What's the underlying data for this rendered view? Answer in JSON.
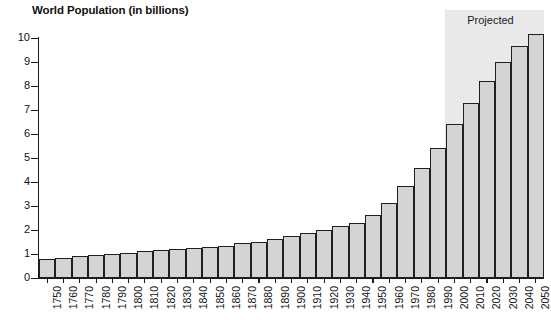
{
  "chart_data": {
    "type": "bar",
    "title": "World Population (in billions)",
    "xlabel": "",
    "ylabel": "",
    "ylim": [
      0,
      10
    ],
    "y_ticks": [
      0,
      1,
      2,
      3,
      4,
      5,
      6,
      7,
      8,
      9,
      10
    ],
    "grid": false,
    "legend": null,
    "annotations": [
      {
        "text": "Projected",
        "region_start_category": "2000",
        "region_end_category": "2050",
        "shading_color": "#e9e9e9"
      }
    ],
    "categories": [
      "1750",
      "1760",
      "1770",
      "1780",
      "1790",
      "1800",
      "1810",
      "1820",
      "1830",
      "1840",
      "1850",
      "1860",
      "1870",
      "1880",
      "1890",
      "1900",
      "1910",
      "1920",
      "1930",
      "1940",
      "1950",
      "1960",
      "1970",
      "1980",
      "1990",
      "2000",
      "2010",
      "2020",
      "2030",
      "2040",
      "2050"
    ],
    "values": [
      0.79,
      0.85,
      0.9,
      0.95,
      1.01,
      1.06,
      1.11,
      1.16,
      1.22,
      1.23,
      1.29,
      1.35,
      1.44,
      1.5,
      1.62,
      1.75,
      1.86,
      1.98,
      2.18,
      2.3,
      2.61,
      3.11,
      3.84,
      4.59,
      5.41,
      6.4,
      7.3,
      8.2,
      9.02,
      9.68,
      10.15
    ],
    "projected_from_index": 25,
    "bar_fill_color": "#d4d4d4",
    "bar_border_color": "#1f1f1f",
    "axis_color": "#1a1a1a"
  }
}
